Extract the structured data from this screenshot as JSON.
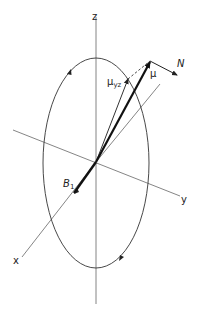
{
  "diagram": {
    "type": "vector-rotation-diagram",
    "axes": {
      "x": {
        "label": "x"
      },
      "y": {
        "label": "y"
      },
      "z": {
        "label": "z"
      }
    },
    "vectors": {
      "mu": {
        "label": "μ"
      },
      "mu_yz": {
        "label": "μ",
        "subscript": "yz"
      },
      "torque": {
        "label": "N"
      },
      "field": {
        "label": "B",
        "subscript": "1"
      }
    },
    "path": {
      "shape": "ellipse",
      "direction_arrows": 3
    }
  },
  "colors": {
    "line": "#555555",
    "bold": "#111111",
    "text": "#222222"
  }
}
